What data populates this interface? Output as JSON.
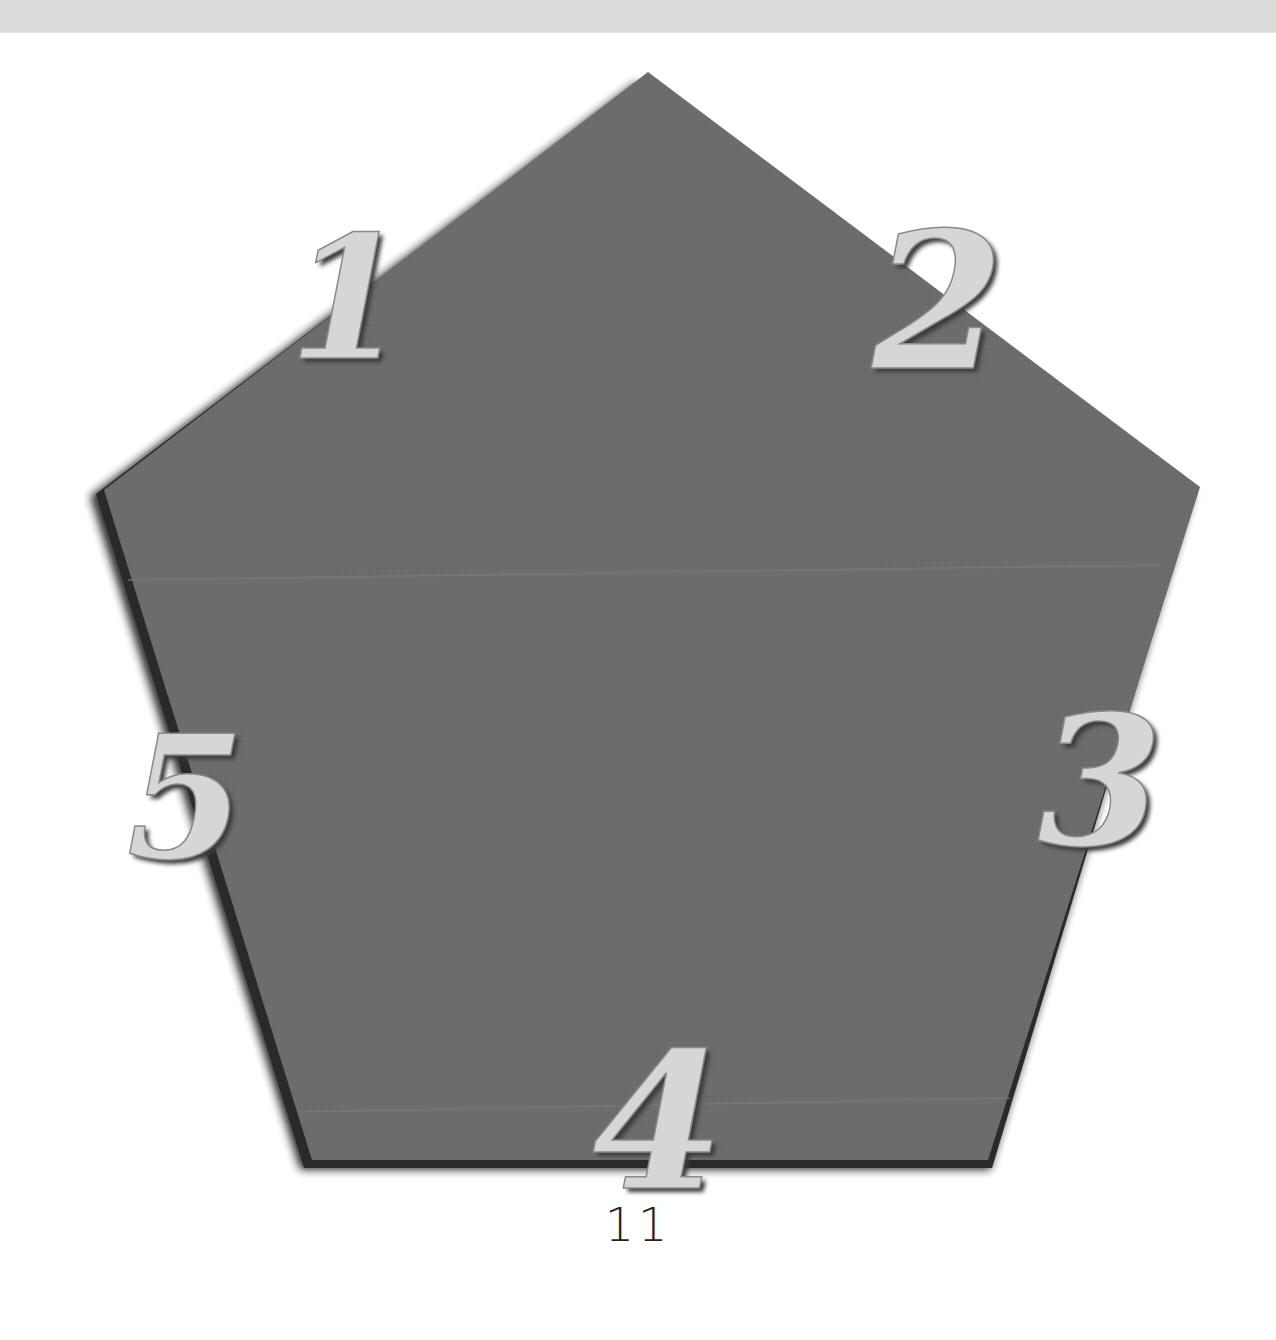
{
  "page": {
    "page_number": "11"
  },
  "figure": {
    "shape": "pentagon",
    "fill_color": "#6b6b6b",
    "shadow_color": "#1e1e1e",
    "label_color": "#d6d6d6",
    "labels": [
      {
        "text": "1",
        "side": "top-left"
      },
      {
        "text": "2",
        "side": "top-right"
      },
      {
        "text": "3",
        "side": "right"
      },
      {
        "text": "4",
        "side": "bottom"
      },
      {
        "text": "5",
        "side": "left"
      }
    ]
  }
}
